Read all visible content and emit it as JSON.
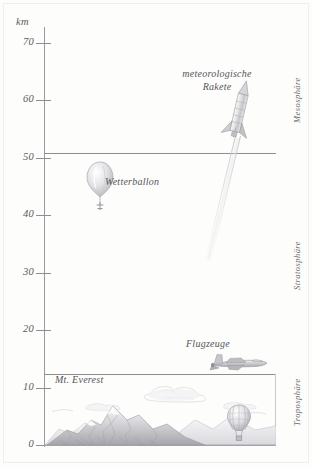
{
  "figure": {
    "unit_label": "km",
    "background_color": "#fdfdfc",
    "ink_color": "#8d8d92",
    "text_color": "#55555a"
  },
  "axis": {
    "ticks": [
      {
        "value": 70,
        "label": "70"
      },
      {
        "value": 60,
        "label": "60"
      },
      {
        "value": 50,
        "label": "50"
      },
      {
        "value": 40,
        "label": "40"
      },
      {
        "value": 30,
        "label": "30"
      },
      {
        "value": 20,
        "label": "20"
      },
      {
        "value": 10,
        "label": "10"
      },
      {
        "value": 0,
        "label": "0"
      }
    ]
  },
  "layers": [
    {
      "name": "Mesosphäre"
    },
    {
      "name": "Stratosphäre"
    },
    {
      "name": "Troposphäre"
    }
  ],
  "objects": [
    {
      "caption": "meteorologische\nRakete",
      "altitude_km": 60
    },
    {
      "caption": "Wetterballon",
      "altitude_km": 45
    },
    {
      "caption": "Flugzeuge",
      "altitude_km": 13
    },
    {
      "caption": "Mt. Everest",
      "altitude_km": 9
    }
  ],
  "chart_data": {
    "type": "scatter",
    "title": "",
    "xlabel": "",
    "ylabel": "km",
    "ylim": [
      0,
      75
    ],
    "yticks": [
      0,
      10,
      20,
      30,
      40,
      50,
      60,
      70
    ],
    "grid": false,
    "legend": "none",
    "annotations": [
      {
        "label": "meteorologische Rakete",
        "y": 60
      },
      {
        "label": "Wetterballon",
        "y": 45
      },
      {
        "label": "Flugzeuge",
        "y": 13
      },
      {
        "label": "Mt. Everest",
        "y": 9
      }
    ],
    "boundaries": [
      {
        "label": "Stratopause",
        "y": 50
      },
      {
        "label": "Tropopause",
        "y": 12
      },
      {
        "label": "Boden",
        "y": 0
      }
    ],
    "bands": [
      {
        "name": "Mesosphäre",
        "y_range": [
          50,
          75
        ]
      },
      {
        "name": "Stratosphäre",
        "y_range": [
          12,
          50
        ]
      },
      {
        "name": "Troposphäre",
        "y_range": [
          0,
          12
        ]
      }
    ]
  }
}
